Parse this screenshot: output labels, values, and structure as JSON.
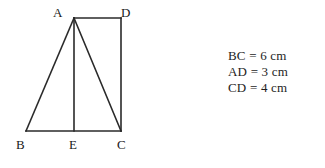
{
  "figure": {
    "name": "triangle-with-rectangle-geometry-figure",
    "stroke_color": "#2a2a2a",
    "background_color": "#ffffff",
    "stroke_width": 1.6,
    "vertices": [
      {
        "id": "A",
        "label": "A",
        "x": 74,
        "y": 18
      },
      {
        "id": "D",
        "label": "D",
        "x": 121,
        "y": 18
      },
      {
        "id": "B",
        "label": "B",
        "x": 26,
        "y": 131
      },
      {
        "id": "E",
        "label": "E",
        "x": 74,
        "y": 131
      },
      {
        "id": "C",
        "label": "C",
        "x": 121,
        "y": 131
      }
    ],
    "segments": [
      {
        "name": "segment-AB",
        "from": "A",
        "to": "B"
      },
      {
        "name": "segment-BC",
        "from": "B",
        "to": "C"
      },
      {
        "name": "segment-AE",
        "from": "A",
        "to": "E"
      },
      {
        "name": "segment-AC",
        "from": "A",
        "to": "C"
      },
      {
        "name": "segment-AD",
        "from": "A",
        "to": "D"
      },
      {
        "name": "segment-DC",
        "from": "D",
        "to": "C"
      }
    ]
  },
  "measurements": {
    "lines": [
      {
        "label": "BC = 6 cm",
        "segment": "BC",
        "value": 6,
        "unit": "cm"
      },
      {
        "label": "AD = 3 cm",
        "segment": "AD",
        "value": 3,
        "unit": "cm"
      },
      {
        "label": "CD = 4 cm",
        "segment": "CD",
        "value": 4,
        "unit": "cm"
      }
    ]
  }
}
